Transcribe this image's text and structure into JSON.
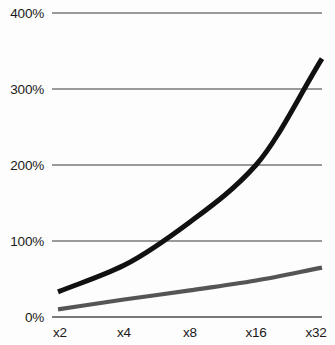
{
  "chart_data": {
    "type": "line",
    "title": "",
    "subtitle": "",
    "xlabel": "",
    "ylabel": "",
    "categories": [
      "x2",
      "x4",
      "x8",
      "x16",
      "x32"
    ],
    "x": [
      2,
      4,
      8,
      16,
      32
    ],
    "xscale": "log2",
    "ylim": [
      0,
      400
    ],
    "yticks": [
      0,
      100,
      200,
      300,
      400
    ],
    "ytick_labels": [
      "0%",
      "100%",
      "200%",
      "300%",
      "400%"
    ],
    "xtick_labels": [
      "x2",
      "x4",
      "x8",
      "x16",
      "x32"
    ],
    "grid": true,
    "legend": "none",
    "series": [
      {
        "name": "upper-curve",
        "color": "#111111",
        "width": 5.0,
        "values": [
          33,
          68,
          125,
          200,
          340
        ]
      },
      {
        "name": "lower-curve",
        "color": "#555555",
        "width": 4.2,
        "values": [
          10,
          23,
          35,
          48,
          65
        ]
      }
    ],
    "colors": {
      "background": "#fdfdfd",
      "gridline": "#9a9a9a",
      "axis": "#7a7a7a",
      "text": "#1a1a1a",
      "series_primary": "#111111",
      "series_secondary": "#555555"
    },
    "geometry": {
      "plot_left": 52,
      "plot_right": 322,
      "plot_top": 13,
      "plot_bottom": 317,
      "ytick_y": [
        317,
        241,
        165,
        89,
        13
      ],
      "xtick_x": [
        58,
        124,
        190,
        256,
        322
      ],
      "xlabel_y": 337,
      "ylabel_x": 44
    }
  }
}
